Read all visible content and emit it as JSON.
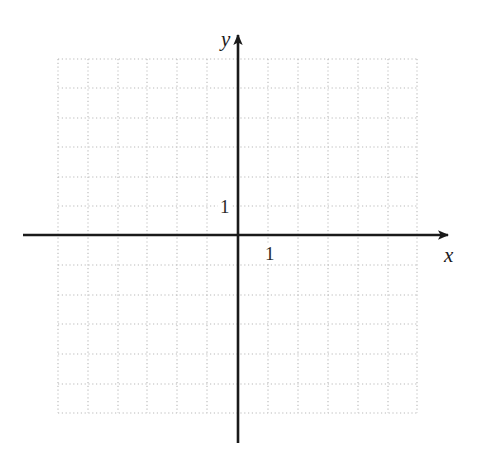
{
  "figure": {
    "kind": "cartesian-coordinate-grid",
    "width": 478,
    "height": 458,
    "background_color": "#ffffff"
  },
  "axes": {
    "x_label": "x",
    "y_label": "y",
    "axis_color": "#1a1a1a",
    "x_axis_y_px": 235,
    "y_axis_x_px": 238,
    "x_axis_start_px": 23,
    "x_axis_end_px": 448,
    "y_axis_start_px": 35,
    "y_axis_end_px": 443,
    "arrow_heads": [
      "x-positive",
      "y-positive"
    ]
  },
  "tick_labels": {
    "y_unit": "1",
    "x_unit": "1",
    "y_unit_pos": {
      "x": 218,
      "y": 197
    },
    "x_unit_pos": {
      "x": 263,
      "y": 244
    }
  },
  "grid": {
    "color": "#b9b9b9",
    "style": "dotted",
    "spacing_px": 29.5,
    "left_px": 58,
    "right_px": 417,
    "top_px": 59,
    "bottom_px": 413,
    "columns": 12,
    "rows": 12,
    "vertical_lines_px": [
      58,
      88,
      118,
      147,
      177,
      207,
      238,
      268,
      298,
      328,
      358,
      388,
      417
    ],
    "horizontal_lines_px": [
      59,
      88,
      118,
      147,
      177,
      206,
      235,
      265,
      295,
      324,
      354,
      384,
      413
    ]
  },
  "chart_data": {
    "type": "scatter",
    "title": "",
    "subtitle": "",
    "xlabel": "x",
    "ylabel": "y",
    "xlim": [
      -6,
      6
    ],
    "ylim": [
      -6,
      6
    ],
    "xticks": [
      -6,
      -5,
      -4,
      -3,
      -2,
      -1,
      0,
      1,
      2,
      3,
      4,
      5,
      6
    ],
    "yticks": [
      -6,
      -5,
      -4,
      -3,
      -2,
      -1,
      0,
      1,
      2,
      3,
      4,
      5,
      6
    ],
    "xtick_labels": [
      "",
      "",
      "",
      "",
      "",
      "",
      "",
      "1",
      "",
      "",
      "",
      "",
      ""
    ],
    "ytick_labels": [
      "",
      "",
      "",
      "",
      "",
      "",
      "",
      "1",
      "",
      "",
      "",
      "",
      ""
    ],
    "grid": true,
    "legend": null,
    "series": [],
    "annotations": []
  }
}
